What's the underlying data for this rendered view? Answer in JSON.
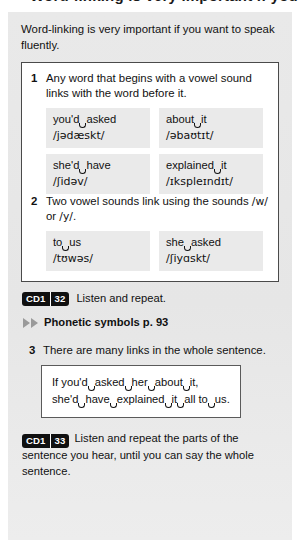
{
  "page": {
    "cutoff_heading": "Word-linking is very important if you",
    "intro": "Word-linking is very important if you want to speak fluently."
  },
  "rules": [
    {
      "number": "1",
      "text": "Any word that begins with a vowel sound links with the word before it."
    },
    {
      "number": "2",
      "text_before": "Two vowel sounds link using the sounds ",
      "sound_1": "/w/",
      "text_middle": " or ",
      "sound_2": "/y/",
      "text_after": "."
    }
  ],
  "examples_rule1": [
    {
      "word_a": "you'd",
      "word_b": "asked",
      "ipa": "/jədæskt/"
    },
    {
      "word_a": "about",
      "word_b": "it",
      "ipa": "/əbaʊtɪt/"
    },
    {
      "word_a": "she'd",
      "word_b": "have",
      "ipa": "/ʃidəv/"
    },
    {
      "word_a": "explained",
      "word_b": "it",
      "ipa": "/ɪkspleɪndɪt/"
    }
  ],
  "examples_rule2": [
    {
      "word_a": "to",
      "word_b": "us",
      "ipa": "/tʊwəs/"
    },
    {
      "word_a": "she",
      "word_b": "asked",
      "ipa": "/ʃiyɑskt/"
    }
  ],
  "audio_1": {
    "cd_label": "CD1",
    "track": "32",
    "instruction": "Listen and repeat."
  },
  "cross_reference": {
    "arrow_icon": "double-triangle-right",
    "label": "Phonetic symbols p. 93"
  },
  "rule_3": {
    "number": "3",
    "text": "There are many links in the whole sentence.",
    "sentence_line_1": [
      {
        "text": "If you'd",
        "link_after": true
      },
      {
        "text": "asked",
        "link_after": true
      },
      {
        "text": "her",
        "link_after": true
      },
      {
        "text": "about",
        "link_after": true
      },
      {
        "text": "it,",
        "link_after": false
      }
    ],
    "sentence_line_2": [
      {
        "text": "she'd",
        "link_after": true
      },
      {
        "text": "have",
        "link_after": true
      },
      {
        "text": "explained",
        "link_after": true
      },
      {
        "text": "it",
        "link_after": true
      },
      {
        "text": "all to",
        "link_after": true
      },
      {
        "text": "us.",
        "link_after": false
      }
    ]
  },
  "audio_2": {
    "cd_label": "CD1",
    "track": "33",
    "instruction": "Listen and repeat the parts of the sentence you hear, until you can say the whole sentence."
  },
  "colors": {
    "panel_background": "#e8e8e8",
    "box_background": "#ffffff",
    "cell_background": "#eaeaea",
    "badge_background": "#101010",
    "arrow_grey": "#9a9a9a",
    "text": "#111111"
  }
}
